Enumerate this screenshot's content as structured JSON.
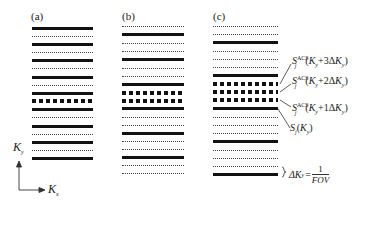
{
  "panels": [
    {
      "label": "(a)",
      "x": 32,
      "width": 61,
      "lines": [
        {
          "y": 28,
          "type": "thick"
        },
        {
          "y": 36,
          "type": "dotted"
        },
        {
          "y": 44,
          "type": "thick"
        },
        {
          "y": 52,
          "type": "dotted"
        },
        {
          "y": 60,
          "type": "thick"
        },
        {
          "y": 68,
          "type": "dotted"
        },
        {
          "y": 77,
          "type": "thick"
        },
        {
          "y": 85,
          "type": "dotted"
        },
        {
          "y": 93,
          "type": "thick"
        },
        {
          "y": 101,
          "type": "square"
        },
        {
          "y": 109,
          "type": "thick"
        },
        {
          "y": 117,
          "type": "dotted"
        },
        {
          "y": 126,
          "type": "thick"
        },
        {
          "y": 134,
          "type": "dotted"
        },
        {
          "y": 142,
          "type": "thick"
        },
        {
          "y": 150,
          "type": "dotted"
        },
        {
          "y": 158,
          "type": "thick"
        }
      ]
    },
    {
      "label": "(b)",
      "x": 122,
      "width": 62,
      "lines": [
        {
          "y": 26,
          "type": "dotted"
        },
        {
          "y": 34,
          "type": "thick"
        },
        {
          "y": 43,
          "type": "dotted"
        },
        {
          "y": 51,
          "type": "dotted"
        },
        {
          "y": 59,
          "type": "thick"
        },
        {
          "y": 68,
          "type": "dotted"
        },
        {
          "y": 76,
          "type": "dotted"
        },
        {
          "y": 84,
          "type": "thick"
        },
        {
          "y": 93,
          "type": "square"
        },
        {
          "y": 101,
          "type": "square"
        },
        {
          "y": 108,
          "type": "thick"
        },
        {
          "y": 117,
          "type": "dotted"
        },
        {
          "y": 125,
          "type": "dotted"
        },
        {
          "y": 133,
          "type": "thick"
        },
        {
          "y": 141,
          "type": "dotted"
        },
        {
          "y": 149,
          "type": "dotted"
        },
        {
          "y": 157,
          "type": "thick"
        },
        {
          "y": 165,
          "type": "dotted"
        },
        {
          "y": 173,
          "type": "dotted"
        }
      ]
    },
    {
      "label": "(c)",
      "x": 213,
      "width": 65,
      "lines": [
        {
          "y": 26,
          "type": "dotted"
        },
        {
          "y": 34,
          "type": "dotted"
        },
        {
          "y": 42,
          "type": "thick"
        },
        {
          "y": 51,
          "type": "dotted"
        },
        {
          "y": 59,
          "type": "dotted"
        },
        {
          "y": 67,
          "type": "dotted"
        },
        {
          "y": 75,
          "type": "thick"
        },
        {
          "y": 84,
          "type": "square"
        },
        {
          "y": 92,
          "type": "square"
        },
        {
          "y": 100,
          "type": "square"
        },
        {
          "y": 108,
          "type": "thick"
        },
        {
          "y": 117,
          "type": "dotted"
        },
        {
          "y": 125,
          "type": "dotted"
        },
        {
          "y": 133,
          "type": "dotted"
        },
        {
          "y": 141,
          "type": "thick"
        },
        {
          "y": 150,
          "type": "dotted"
        },
        {
          "y": 158,
          "type": "dotted"
        },
        {
          "y": 166,
          "type": "dotted"
        },
        {
          "y": 174,
          "type": "thick"
        }
      ]
    }
  ],
  "annotations": {
    "acs3": {
      "S": "S",
      "sub": "j",
      "sup": "ACS",
      "arg_open": "(",
      "K": "K",
      "ksub": "y",
      "mid": "+3Δ",
      "K2": "K",
      "k2sub": "y",
      "close": ")"
    },
    "acs2": {
      "S": "S",
      "sub": "j",
      "sup": "ACS",
      "arg_open": "(",
      "K": "K",
      "ksub": "y",
      "mid": "+2Δ",
      "K2": "K",
      "k2sub": "y",
      "close": ")"
    },
    "acs1": {
      "S": "S",
      "sub": "j",
      "sup": "ACS",
      "arg_open": "(",
      "K": "K",
      "ksub": "y",
      "mid": "+1Δ",
      "K2": "K",
      "k2sub": "y",
      "close": ")"
    },
    "sj": {
      "S": "S",
      "sub": "j",
      "arg_open": "(",
      "K": "K",
      "ksub": "y",
      "close": ")"
    },
    "delta": {
      "lhs": "ΔK",
      "lhs_sub": "y",
      "eq": "=",
      "num": "1",
      "den": "FOV"
    }
  },
  "axes": {
    "y_label": "K",
    "y_sub": "y",
    "x_label": "K",
    "x_sub": "x"
  }
}
